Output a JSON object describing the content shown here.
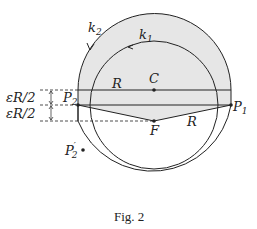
{
  "figure": {
    "caption": "Fig. 2",
    "labels": {
      "k2": "k",
      "k2_sub": "2",
      "k1": "k",
      "k1_sub": "1",
      "C": "C",
      "R_top": "R",
      "R_bottom": "R",
      "F": "F",
      "P1": "P",
      "P1_sub": "1",
      "P2": "P",
      "P2_sub": "2",
      "P2prime": "P",
      "P2prime_sub": "2",
      "P2prime_mark": "′",
      "epsR2_upper": "εR/2",
      "epsR2_lower": "εR/2"
    },
    "colors": {
      "fill": "#e6e6e6",
      "stroke": "#222222"
    }
  }
}
